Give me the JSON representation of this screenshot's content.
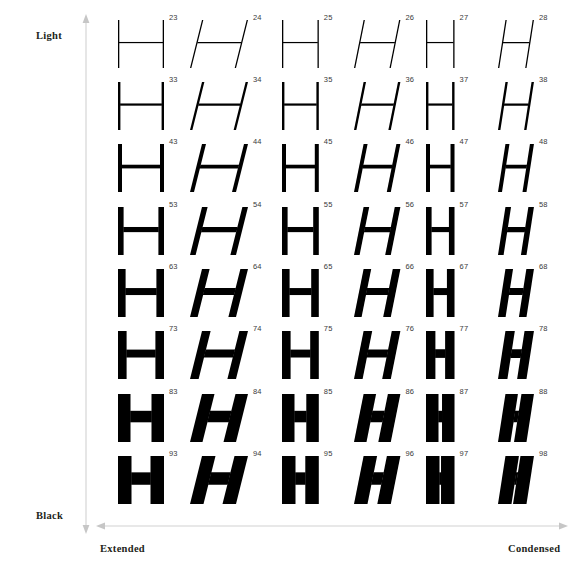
{
  "page": {
    "background_color": "#ffffff",
    "glyph": "H"
  },
  "axes": {
    "vertical": {
      "name": "weight-axis",
      "top_label": "Light",
      "bottom_label": "Black",
      "arrow_color": "#cfcfcf",
      "double_headed": true
    },
    "horizontal": {
      "name": "width-axis",
      "left_label": "Extended",
      "right_label": "Condensed",
      "arrow_color": "#cfcfcf",
      "double_headed": true
    }
  },
  "chart_data": {
    "type": "table",
    "xlabel": "Width / slant  (Extended → Condensed)",
    "ylabel": "Weight (Light → Black)",
    "row_labels": [
      "Light",
      "",
      "",
      "",
      "",
      "",
      "",
      "Black"
    ],
    "column_labels": [
      "Extended",
      "Extended Oblique",
      "Regular",
      "Oblique",
      "Condensed",
      "Condensed Oblique"
    ],
    "legend_position": "none",
    "grid": false,
    "rows": [
      {
        "weight_name": "Ultra Light",
        "stroke": 1.3,
        "cells": [
          {
            "number": "23",
            "oblique": false,
            "width": 1.0,
            "stroke": 1.3
          },
          {
            "number": "24",
            "oblique": true,
            "width": 1.0,
            "stroke": 1.3
          },
          {
            "number": "25",
            "oblique": false,
            "width": 0.8,
            "stroke": 1.3
          },
          {
            "number": "26",
            "oblique": true,
            "width": 0.8,
            "stroke": 1.3
          },
          {
            "number": "27",
            "oblique": false,
            "width": 0.62,
            "stroke": 1.3
          },
          {
            "number": "28",
            "oblique": true,
            "width": 0.62,
            "stroke": 1.3
          }
        ]
      },
      {
        "weight_name": "Thin",
        "stroke": 2.4,
        "cells": [
          {
            "number": "33",
            "oblique": false,
            "width": 1.0,
            "stroke": 2.4
          },
          {
            "number": "34",
            "oblique": true,
            "width": 1.0,
            "stroke": 2.4
          },
          {
            "number": "35",
            "oblique": false,
            "width": 0.8,
            "stroke": 2.4
          },
          {
            "number": "36",
            "oblique": true,
            "width": 0.8,
            "stroke": 2.4
          },
          {
            "number": "37",
            "oblique": false,
            "width": 0.62,
            "stroke": 2.4
          },
          {
            "number": "38",
            "oblique": true,
            "width": 0.62,
            "stroke": 2.4
          }
        ]
      },
      {
        "weight_name": "Light",
        "stroke": 4.0,
        "cells": [
          {
            "number": "43",
            "oblique": false,
            "width": 1.0,
            "stroke": 4.0
          },
          {
            "number": "44",
            "oblique": true,
            "width": 1.0,
            "stroke": 4.0
          },
          {
            "number": "45",
            "oblique": false,
            "width": 0.8,
            "stroke": 4.0
          },
          {
            "number": "46",
            "oblique": true,
            "width": 0.8,
            "stroke": 4.0
          },
          {
            "number": "47",
            "oblique": false,
            "width": 0.62,
            "stroke": 4.0
          },
          {
            "number": "48",
            "oblique": true,
            "width": 0.62,
            "stroke": 4.0
          }
        ]
      },
      {
        "weight_name": "Roman",
        "stroke": 5.6,
        "cells": [
          {
            "number": "53",
            "oblique": false,
            "width": 1.0,
            "stroke": 5.6
          },
          {
            "number": "54",
            "oblique": true,
            "width": 1.0,
            "stroke": 5.6
          },
          {
            "number": "55",
            "oblique": false,
            "width": 0.8,
            "stroke": 5.6
          },
          {
            "number": "56",
            "oblique": true,
            "width": 0.8,
            "stroke": 5.6
          },
          {
            "number": "57",
            "oblique": false,
            "width": 0.62,
            "stroke": 5.6
          },
          {
            "number": "58",
            "oblique": true,
            "width": 0.62,
            "stroke": 5.6
          }
        ]
      },
      {
        "weight_name": "Medium",
        "stroke": 7.6,
        "cells": [
          {
            "number": "63",
            "oblique": false,
            "width": 1.0,
            "stroke": 7.6
          },
          {
            "number": "64",
            "oblique": true,
            "width": 1.0,
            "stroke": 7.6
          },
          {
            "number": "65",
            "oblique": false,
            "width": 0.8,
            "stroke": 7.6
          },
          {
            "number": "66",
            "oblique": true,
            "width": 0.8,
            "stroke": 7.6
          },
          {
            "number": "67",
            "oblique": false,
            "width": 0.62,
            "stroke": 7.6
          },
          {
            "number": "68",
            "oblique": true,
            "width": 0.62,
            "stroke": 7.6
          }
        ]
      },
      {
        "weight_name": "Bold",
        "stroke": 8.6,
        "cells": [
          {
            "number": "73",
            "oblique": false,
            "width": 1.0,
            "stroke": 8.6
          },
          {
            "number": "74",
            "oblique": true,
            "width": 1.0,
            "stroke": 8.6
          },
          {
            "number": "75",
            "oblique": false,
            "width": 0.8,
            "stroke": 8.6
          },
          {
            "number": "76",
            "oblique": true,
            "width": 0.8,
            "stroke": 8.6
          },
          {
            "number": "77",
            "oblique": false,
            "width": 0.62,
            "stroke": 9.4
          },
          {
            "number": "78",
            "oblique": true,
            "width": 0.62,
            "stroke": 9.4
          }
        ]
      },
      {
        "weight_name": "Extra Bold",
        "stroke": 12.5,
        "cells": [
          {
            "number": "83",
            "oblique": false,
            "width": 1.0,
            "stroke": 12.5
          },
          {
            "number": "84",
            "oblique": true,
            "width": 1.0,
            "stroke": 12.5
          },
          {
            "number": "85",
            "oblique": false,
            "width": 0.8,
            "stroke": 12.5
          },
          {
            "number": "86",
            "oblique": true,
            "width": 0.8,
            "stroke": 12.5
          },
          {
            "number": "87",
            "oblique": false,
            "width": 0.62,
            "stroke": 12.5
          },
          {
            "number": "88",
            "oblique": true,
            "width": 0.62,
            "stroke": 12.5
          }
        ]
      },
      {
        "weight_name": "Black",
        "stroke": 13.5,
        "cells": [
          {
            "number": "93",
            "oblique": false,
            "width": 1.0,
            "stroke": 13.5
          },
          {
            "number": "94",
            "oblique": true,
            "width": 1.0,
            "stroke": 13.5
          },
          {
            "number": "95",
            "oblique": false,
            "width": 0.8,
            "stroke": 13.5
          },
          {
            "number": "96",
            "oblique": true,
            "width": 0.8,
            "stroke": 13.5
          },
          {
            "number": "97",
            "oblique": false,
            "width": 0.62,
            "stroke": 13.5
          },
          {
            "number": "98",
            "oblique": true,
            "width": 0.62,
            "stroke": 13.5
          }
        ]
      }
    ]
  },
  "layout": {
    "row_tops": [
      0,
      62,
      124,
      187,
      249,
      311,
      374,
      436
    ],
    "column_lefts": [
      0,
      72,
      164,
      236,
      308,
      380
    ],
    "glyph_height": 48,
    "base_glyph_width": 46,
    "oblique_shear": 12,
    "glyph_color": "#000000"
  }
}
